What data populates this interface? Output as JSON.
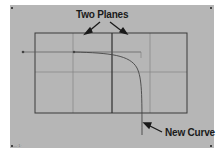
{
  "diagram": {
    "labels": {
      "planes": "Two Planes",
      "curve": "New Curve"
    },
    "corner_text": "—·1·",
    "colors": {
      "background": "#b6b6b6",
      "lines": "#3a3a3a",
      "grid": "#7e7e7e"
    }
  }
}
